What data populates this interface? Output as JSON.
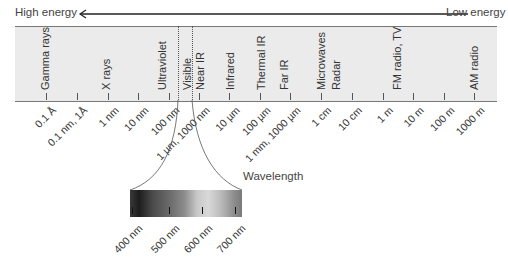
{
  "header": {
    "high_energy": "High energy",
    "low_energy": "Low energy"
  },
  "regions": [
    {
      "label": "Gamma rays",
      "x": 46
    },
    {
      "label": "X rays",
      "x": 107
    },
    {
      "label": "Ultraviolet",
      "x": 163
    },
    {
      "label": "Visible",
      "x": 188
    },
    {
      "label": "Near IR",
      "x": 201
    },
    {
      "label": "Infrared",
      "x": 231
    },
    {
      "label": "Thermal IR",
      "x": 262
    },
    {
      "label": "Far IR",
      "x": 285
    },
    {
      "label": "Microwaves",
      "x": 322
    },
    {
      "label": "Radar",
      "x": 337
    },
    {
      "label": "FM radio, TV",
      "x": 398
    },
    {
      "label": "AM radio",
      "x": 475
    }
  ],
  "ticks": [
    {
      "label": "0.1 Å",
      "x": 46
    },
    {
      "label": "0.1 nm, 1Å",
      "x": 77
    },
    {
      "label": "1 nm",
      "x": 108
    },
    {
      "label": "10 nm",
      "x": 138
    },
    {
      "label": "100 nm",
      "x": 169
    },
    {
      "label": "1 µm, 1000 nm",
      "x": 199
    },
    {
      "label": "10 µm",
      "x": 229
    },
    {
      "label": "100 µm",
      "x": 260
    },
    {
      "label": "1 mm, 1000 µm",
      "x": 290
    },
    {
      "label": "1 cm",
      "x": 321
    },
    {
      "label": "10 cm",
      "x": 352
    },
    {
      "label": "1 m",
      "x": 383
    },
    {
      "label": "10 m",
      "x": 413
    },
    {
      "label": "100 m",
      "x": 444
    },
    {
      "label": "1000 m",
      "x": 474
    }
  ],
  "visible_inset": {
    "axis_label": "Wavelength",
    "ticks": [
      {
        "label": "400 nm",
        "x": 132
      },
      {
        "label": "500 nm",
        "x": 169
      },
      {
        "label": "600 nm",
        "x": 202
      },
      {
        "label": "700 nm",
        "x": 235
      }
    ]
  }
}
